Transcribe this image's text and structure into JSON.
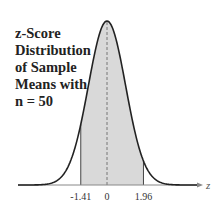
{
  "title_lines": [
    "z-Score",
    "Distribution",
    "of Sample",
    "Means with",
    "n = 50"
  ],
  "colors": {
    "curve": "#222222",
    "shade": "#d9d9d9",
    "axis": "#888888",
    "text": "#222222"
  },
  "chart_data": {
    "type": "area",
    "title": "z-Score Distribution of Sample Means with n = 50",
    "xlabel": "z",
    "ylabel": "",
    "distribution": "standard normal",
    "mean": 0,
    "shaded_region": [
      -1.41,
      1.96
    ],
    "tick_labels": [
      "-1.41",
      "0",
      "1.96"
    ],
    "x_ticks": [
      -1.41,
      0,
      1.96
    ],
    "xlim": [
      -3.5,
      3.5
    ],
    "grid": false,
    "legend": "none"
  }
}
